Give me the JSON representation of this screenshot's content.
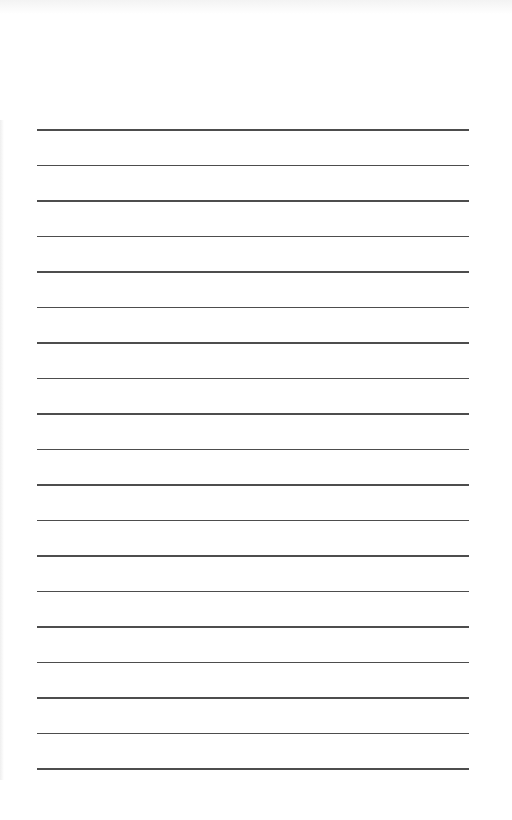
{
  "page": {
    "type": "lined-paper",
    "background_color": "#ffffff",
    "line_color": "#3a3a3a",
    "line_count": 19,
    "first_line_y": 129,
    "line_spacing": 35.5,
    "line_left": 37,
    "line_right": 469
  }
}
